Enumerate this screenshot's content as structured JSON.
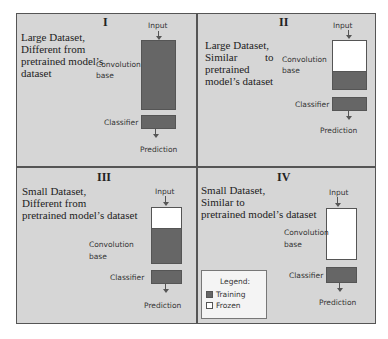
{
  "figure": {
    "legend": {
      "title": "Legend:",
      "items": [
        {
          "label": "Training",
          "color": "#666666"
        },
        {
          "label": "Frozen",
          "color": "#ffffff"
        }
      ]
    },
    "labels": {
      "input": "Input",
      "conv_line1": "Convolution",
      "conv_line2": "base",
      "classifier": "Classifier",
      "prediction": "Prediction"
    },
    "panels": [
      {
        "numeral": "I",
        "desc_lines": [
          "Large Dataset,",
          "Different from",
          "pretrained model’s",
          "dataset"
        ],
        "conv_frozen_fraction": 0.0,
        "classifier": "Training"
      },
      {
        "numeral": "II",
        "desc_lines": [
          "Large Dataset,",
          "Similar          to",
          "pretrained",
          "model’s dataset"
        ],
        "conv_frozen_fraction": 0.6,
        "classifier": "Training"
      },
      {
        "numeral": "III",
        "desc_lines": [
          "Small Dataset,",
          "Different from",
          "pretrained model’s dataset"
        ],
        "conv_frozen_fraction": 0.38,
        "classifier": "Training"
      },
      {
        "numeral": "IV",
        "desc_lines": [
          "Small Dataset,",
          "Similar to",
          "pretrained model’s dataset"
        ],
        "conv_frozen_fraction": 1.0,
        "classifier": "Training"
      }
    ],
    "colors": {
      "training": "#666666",
      "frozen": "#ffffff",
      "panel_bg": "#d4d4d4",
      "border": "#555555"
    }
  }
}
